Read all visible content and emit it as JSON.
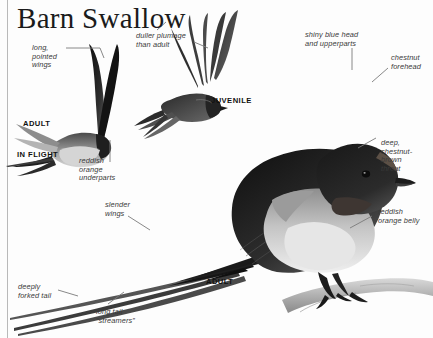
{
  "page": {
    "title": "Barn Swallow",
    "background_color": "#fdfdfd",
    "rule_color": "#b9b9b9"
  },
  "plate_labels": [
    {
      "id": "adult-in-flight-adult",
      "text": "ADULT"
    },
    {
      "id": "adult-in-flight",
      "text": "IN FLIGHT"
    },
    {
      "id": "juvenile",
      "text": "JUVENILE"
    },
    {
      "id": "adult-perched",
      "text": "ADULT"
    }
  ],
  "annotations": [
    {
      "id": "long-pointed-wings",
      "text": "long,\npointed\nwings"
    },
    {
      "id": "duller-plumage",
      "text": "duller plumage\nthan adult"
    },
    {
      "id": "shiny-blue-head",
      "text": "shiny blue head\nand upperparts"
    },
    {
      "id": "chestnut-forehead",
      "text": "chestnut\nforehead"
    },
    {
      "id": "reddish-orange-underparts",
      "text": "reddish\norange\nunderparts"
    },
    {
      "id": "deep-chestnut-brown-throat",
      "text": "deep,\nchestnut-\nbrown\nthroat"
    },
    {
      "id": "slender-wings",
      "text": "slender\nwings"
    },
    {
      "id": "reddish-orange-belly",
      "text": "reddish\norange belly"
    },
    {
      "id": "deeply-forked-tail",
      "text": "deeply\nforked tail"
    },
    {
      "id": "long-tail-streamers",
      "text": "long tail\n“streamers”"
    }
  ],
  "illustrations": [
    {
      "id": "adult-in-flight-illustration",
      "subject": "Barn Swallow adult in flight, side view, wings raised, deeply forked tail with streamers"
    },
    {
      "id": "juvenile-in-flight-illustration",
      "subject": "Barn Swallow juvenile in flight, wings spread, duller plumage, shorter tail"
    },
    {
      "id": "adult-perched-illustration",
      "subject": "Barn Swallow adult perched on a branch, glossy blue head and upperparts, chestnut throat, reddish orange belly, long tail streamers"
    }
  ]
}
